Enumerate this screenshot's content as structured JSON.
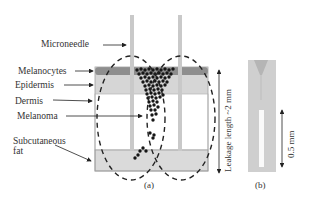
{
  "figure": {
    "panel_a": {
      "caption": "(a)",
      "labels": {
        "microneedle": "Microneedle",
        "melanocytes": "Melanocytes",
        "epidermis": "Epidermis",
        "dermis": "Dermis",
        "melanoma": "Melanoma",
        "subcutaneous_fat_line1": "Subcutaneous",
        "subcutaneous_fat_line2": "fat"
      },
      "dimension_label": "Leakage length ~2 mm",
      "colors": {
        "melanocytes_band": "#8c8c8c",
        "epidermis": "#d9d9d9",
        "dermis": "#ffffff",
        "subcutaneous_fat": "#dcdcdc",
        "needle": "#c8c8c8",
        "melanoma_dots": "#1a1a1a",
        "outline": "#999999"
      }
    },
    "panel_b": {
      "caption": "(b)",
      "scale_label": "0.5 mm"
    }
  }
}
